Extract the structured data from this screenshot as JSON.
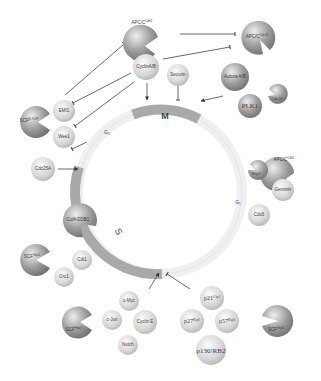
{
  "diagram": {
    "phases": {
      "M": "M",
      "G1": "G1",
      "S": "S",
      "G2": "G2"
    },
    "ligases": {
      "apc_cdc20": "APC/C",
      "apc_cdc20_sup": "Cdc20",
      "apc_cdh1_top": "APC/C",
      "apc_cdh1_top_sup": "Cdh1",
      "apc_cdh1_right": "APC/C",
      "apc_cdh1_right_sup": "Cdh1",
      "scf_btrcp": "SCF",
      "scf_btrcp_sup": "β-TrCP",
      "cul4_ddb1": "Cul4-DDB1",
      "scf_skp2_left": "SCF",
      "scf_skp2_left_sup": "Skp2",
      "scf_fbw7": "SCF",
      "scf_fbw7_sup": "Fbw7",
      "scf_skp2_right": "SCF",
      "scf_skp2_right_sup": "Skp2",
      "cdc20": "Cdc20",
      "skp2": "Skp2"
    },
    "substrates": {
      "cyclin_ab": "CyclinA/B",
      "securin": "Securin",
      "aurora_ab": "Aurora A/B",
      "plk1": "PLK1",
      "emi1": "EMI1",
      "wee1": "Wee1",
      "cdc25a": "Cdc25A",
      "geminin": "Geminin",
      "cdc6": "Cdc6",
      "cdt1": "Cdt1",
      "orc1": "Orc1",
      "c_myc": "c-Myc",
      "c_jun": "c-Jun",
      "cyclin_e": "Cyclin E",
      "notch": "Notch",
      "p21": "p21",
      "p21_sup": "Cip1",
      "p27": "p27",
      "p27_sup": "Kip1",
      "p57": "p57",
      "p57_sup": "Kip2",
      "p130": "p130/RB2"
    },
    "colors": {
      "ring_light": "#f2f2f2",
      "ring_dark": "#a9a9a9",
      "ligase": "#8e8e8e",
      "substrate": "#d6d6d6",
      "line": "#444444"
    }
  }
}
